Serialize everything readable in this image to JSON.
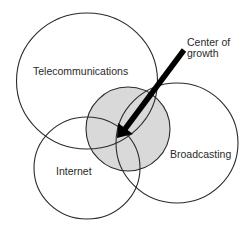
{
  "diagram": {
    "type": "venn",
    "colors": {
      "stroke": "#2a2a2a",
      "center_fill": "#d9d9d9",
      "background": "#ffffff",
      "arrow": "#000000"
    },
    "sets": [
      {
        "id": "telecommunications",
        "label": "Telecommunications"
      },
      {
        "id": "internet",
        "label": "Internet"
      },
      {
        "id": "broadcasting",
        "label": "Broadcasting"
      }
    ],
    "center": {
      "label_line1": "Center of",
      "label_line2": "growth"
    }
  }
}
